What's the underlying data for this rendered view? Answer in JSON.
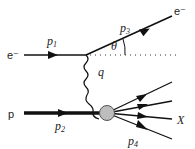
{
  "diagram": {
    "labels": {
      "incoming_electron": "e⁻",
      "outgoing_electron": "e⁻",
      "proton": "p",
      "p1": {
        "base": "p",
        "sub": "1"
      },
      "p2": {
        "base": "p",
        "sub": "2"
      },
      "p3": {
        "base": "p",
        "sub": "3"
      },
      "p4": {
        "base": "p",
        "sub": "4"
      },
      "photon": "q",
      "angle": "θ",
      "hadrons": "X"
    },
    "colors": {
      "line": "#111111",
      "blob_fill": "#bdbdbd",
      "blob_stroke": "#555555"
    },
    "hadron_line_count": 4
  }
}
